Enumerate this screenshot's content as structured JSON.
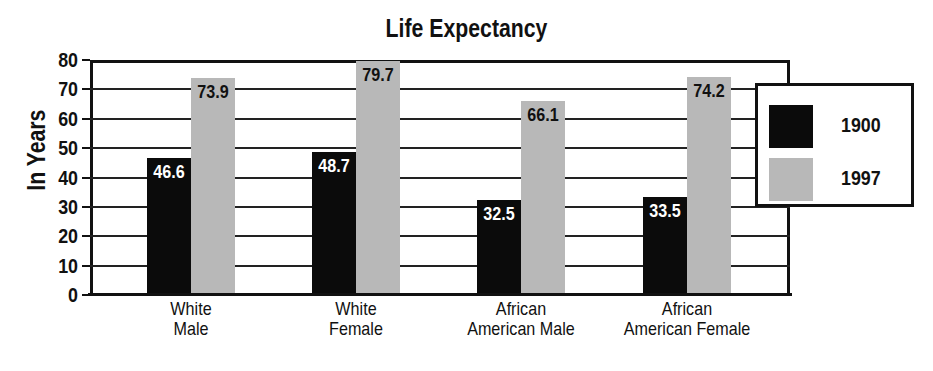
{
  "chart_data": {
    "type": "bar",
    "title": "Life Expectancy",
    "xlabel": "",
    "ylabel": "In Years",
    "ylim": [
      0,
      80
    ],
    "yticks": [
      "0",
      "10",
      "20",
      "30",
      "40",
      "50",
      "60",
      "70",
      "80"
    ],
    "grid": true,
    "legend_position": "right",
    "categories": [
      "White Male",
      "White Female",
      "African American Male",
      "African American Female"
    ],
    "category_lines": [
      [
        "White",
        "Male"
      ],
      [
        "White",
        "Female"
      ],
      [
        "African",
        "American Male"
      ],
      [
        "African",
        "American Female"
      ]
    ],
    "series": [
      {
        "name": "1900",
        "color": "#0b0b0b",
        "values": [
          46.6,
          48.7,
          32.5,
          33.5
        ],
        "labels": [
          "46.6",
          "48.7",
          "32.5",
          "33.5"
        ]
      },
      {
        "name": "1997",
        "color": "#b8b8b8",
        "values": [
          73.9,
          79.7,
          66.1,
          74.2
        ],
        "labels": [
          "73.9",
          "79.7",
          "66.1",
          "74.2"
        ]
      }
    ]
  }
}
